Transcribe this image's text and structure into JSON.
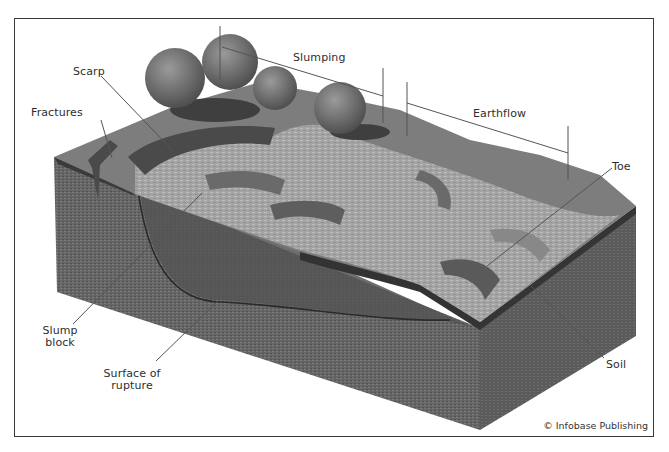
{
  "figure": {
    "type": "block-diagram",
    "labels": {
      "slumping": "Slumping",
      "earthflow": "Earthflow",
      "scarp": "Scarp",
      "fractures": "Fractures",
      "toe": "Toe",
      "slump_block_line1": "Slump",
      "slump_block_line2": "block",
      "surface_rupture_line1": "Surface of",
      "surface_rupture_line2": "rupture",
      "soil": "Soil"
    },
    "credit": "© Infobase Publishing",
    "colors": {
      "frame_border": "#3a3a3a",
      "ground_top": "#7d7d7d",
      "ground_light": "#a9a9a9",
      "block_side_front": "#6a6a6a",
      "block_side_right": "#5e5e5e",
      "soil_layer": "#3b3b3b",
      "slump_block": "#555555",
      "trees": "#6f6f6f",
      "tree_shadow": "#3f3f3f",
      "leader_line": "#555555"
    }
  }
}
